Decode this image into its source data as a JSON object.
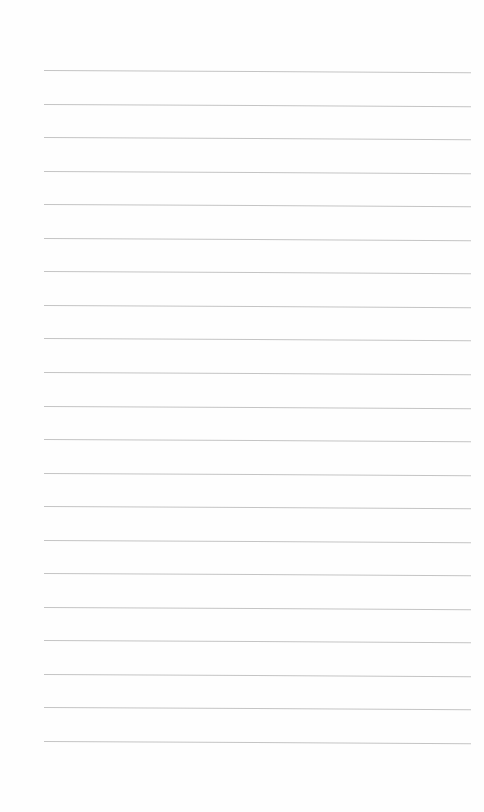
{
  "document": {
    "type": "lined-paper",
    "line_count": 21,
    "text": "",
    "colors": {
      "paper": "#fefefe",
      "rule": "#c4c4c4"
    }
  }
}
